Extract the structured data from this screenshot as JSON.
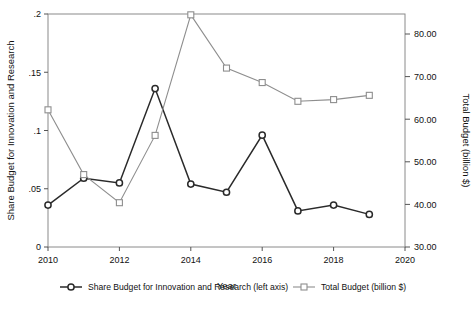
{
  "chart_data": {
    "type": "line",
    "title": "",
    "xlabel": "Year",
    "ylabel": "Share Budget for Innovation and Research",
    "y2label": "Total Budget (billion $)",
    "x": [
      2010,
      2011,
      2012,
      2013,
      2014,
      2015,
      2016,
      2017,
      2018,
      2019
    ],
    "xlim": [
      2010,
      2020
    ],
    "xticks": [
      2010,
      2012,
      2014,
      2016,
      2018,
      2020
    ],
    "xtick_labels": [
      "2010",
      "2012",
      "2014",
      "2016",
      "2018",
      "2020"
    ],
    "ylim": [
      0,
      0.2
    ],
    "yticks": [
      0,
      0.05,
      0.1,
      0.15,
      0.2
    ],
    "ytick_labels": [
      "0",
      ".05",
      ".1",
      ".15",
      ".2"
    ],
    "y2lim": [
      30,
      80
    ],
    "y2ticks": [
      30,
      40,
      50,
      60,
      70,
      80
    ],
    "y2tick_labels": [
      "30.00",
      "40.00",
      "50.00",
      "60.00",
      "70.00",
      "80.00"
    ],
    "grid": false,
    "legend_position": "bottom",
    "series": [
      {
        "name": "Share Budget for Innovation and Research (left axis)",
        "axis": "left",
        "color": "#2a2a2a",
        "marker": "circle",
        "values": [
          0.036,
          0.059,
          0.055,
          0.136,
          0.054,
          0.047,
          0.096,
          0.031,
          0.036,
          0.028
        ]
      },
      {
        "name": "Total Budget (billion $)",
        "axis": "right",
        "color": "#8e8e8e",
        "marker": "square",
        "values": [
          62.2,
          47.0,
          40.4,
          56.2,
          84.5,
          72.0,
          68.6,
          64.2,
          64.6,
          65.6
        ]
      }
    ]
  },
  "legend": {
    "entries": [
      {
        "label": "Share Budget for Innovation and Research (left axis)",
        "color": "#2a2a2a",
        "marker": "circle"
      },
      {
        "label": "Total Budget (billion $)",
        "color": "#8e8e8e",
        "marker": "square"
      }
    ]
  }
}
